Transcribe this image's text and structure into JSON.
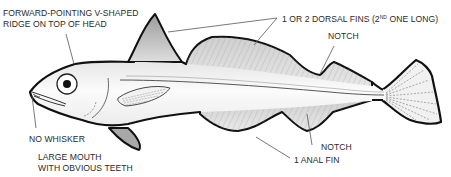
{
  "figure": {
    "colors": {
      "outline": "#111111",
      "body_fill": "#f4f4f4",
      "fin_shade": "#b9b9b9",
      "leader_line": "#555555",
      "label_text": "#2a2a2a",
      "background": "#ffffff"
    }
  },
  "labels": {
    "v_ridge": {
      "line1": "FORWARD-POINTING V-SHAPED",
      "line2": "RIDGE ON TOP OF HEAD"
    },
    "dorsal_fins": {
      "prefix": "1 OR 2 DORSAL FINS (2",
      "superscript": "ND",
      "suffix": " ONE LONG)"
    },
    "notch_top": "NOTCH",
    "notch_bottom": "NOTCH",
    "no_whisker": "NO WHISKER",
    "large_mouth": {
      "line1": "LARGE MOUTH",
      "line2": "WITH OBVIOUS TEETH"
    },
    "anal_fin": "1 ANAL FIN"
  }
}
